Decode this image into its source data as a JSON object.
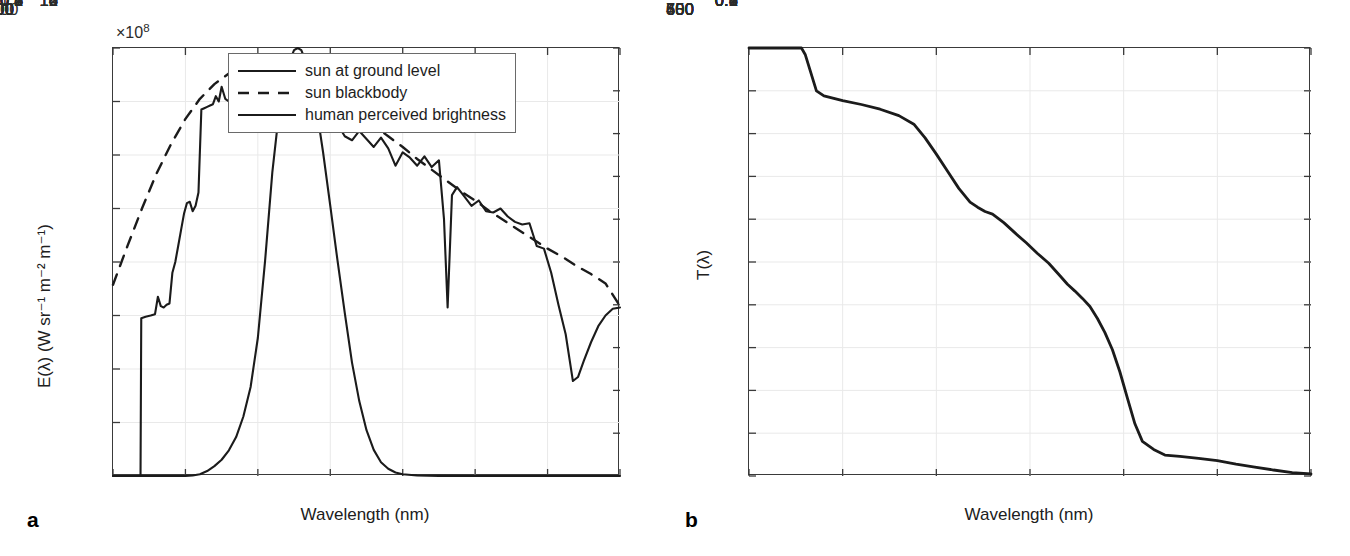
{
  "figure": {
    "panel_a_letter": "a",
    "panel_b_letter": "b"
  },
  "panel_a": {
    "xlabel": "Wavelength (nm)",
    "ylabel_left": "E(λ) (W sr⁻¹ m⁻² m⁻¹)",
    "exponent_label": "×10",
    "exponent_power": "8",
    "legend": [
      {
        "label": "sun at ground level",
        "style": "solid"
      },
      {
        "label": "sun blackbody",
        "style": "dashed"
      },
      {
        "label": "human perceived brightness",
        "style": "solid"
      }
    ]
  },
  "panel_b": {
    "xlabel": "Wavelength (nm)",
    "ylabel": "T(λ)"
  },
  "chart_data": [
    {
      "type": "line",
      "id": "panel-a",
      "title": "",
      "xlabel": "Wavelength (nm)",
      "ylabel": "E(λ) (W sr⁻¹ m⁻² m⁻¹)",
      "ylabel_right": "human perceived brightness (normalized)",
      "xlim": [
        300,
        1000
      ],
      "ylim": [
        0,
        16
      ],
      "ylim_right": [
        0,
        1
      ],
      "y_scale_exponent": 8,
      "xticks": [
        300,
        400,
        500,
        600,
        700,
        800,
        900,
        1000
      ],
      "yticks": [
        0,
        2,
        4,
        6,
        8,
        10,
        12,
        14,
        16
      ],
      "yticks_right": [
        0,
        0.1,
        0.2,
        0.3,
        0.4,
        0.5,
        0.6,
        0.7,
        0.8,
        0.9,
        1
      ],
      "grid": true,
      "legend_position": "upper-center-right",
      "series": [
        {
          "name": "sun at ground level",
          "style": "solid",
          "axis": "left",
          "x": [
            300,
            338,
            339,
            345,
            352,
            358,
            362,
            366,
            370,
            374,
            378,
            382,
            386,
            390,
            394,
            398,
            402,
            406,
            410,
            414,
            418,
            422,
            426,
            430,
            434,
            438,
            442,
            446,
            450,
            455,
            460,
            465,
            470,
            475,
            480,
            485,
            490,
            495,
            500,
            505,
            510,
            515,
            520,
            525,
            530,
            535,
            540,
            545,
            550,
            555,
            560,
            565,
            570,
            575,
            580,
            585,
            590,
            595,
            600,
            610,
            620,
            630,
            640,
            650,
            660,
            670,
            680,
            690,
            700,
            710,
            720,
            730,
            740,
            750,
            757,
            762,
            768,
            775,
            785,
            795,
            805,
            815,
            825,
            835,
            845,
            855,
            865,
            875,
            885,
            895,
            905,
            915,
            925,
            935,
            942,
            950,
            960,
            970,
            980,
            990,
            1000
          ],
          "y": [
            0,
            0,
            5.9,
            5.95,
            6.0,
            6.05,
            6.7,
            6.35,
            6.3,
            6.4,
            6.45,
            7.6,
            8.0,
            8.6,
            9.2,
            9.8,
            10.2,
            10.25,
            9.9,
            10.1,
            10.6,
            13.7,
            13.75,
            13.8,
            13.85,
            13.9,
            14.2,
            14.0,
            14.55,
            14.1,
            14.0,
            14.5,
            13.95,
            14.35,
            13.95,
            14.4,
            14.0,
            14.35,
            14.0,
            14.45,
            14.05,
            14.3,
            14.0,
            14.4,
            13.95,
            14.25,
            14.05,
            14.3,
            13.95,
            14.1,
            13.6,
            13.95,
            13.5,
            13.55,
            13.2,
            13.4,
            13.1,
            13.3,
            12.9,
            13.15,
            12.7,
            12.55,
            12.9,
            12.6,
            12.3,
            12.65,
            12.25,
            11.6,
            12.1,
            11.9,
            11.6,
            11.95,
            11.55,
            11.8,
            9.6,
            6.3,
            10.5,
            10.8,
            10.45,
            10.1,
            10.3,
            9.9,
            9.85,
            10.0,
            9.7,
            9.5,
            9.4,
            9.45,
            8.6,
            8.5,
            7.6,
            6.4,
            5.3,
            3.55,
            3.7,
            4.3,
            5.0,
            5.6,
            6.0,
            6.25,
            6.3
          ]
        },
        {
          "name": "sun blackbody",
          "style": "dashed",
          "axis": "left",
          "x": [
            300,
            320,
            340,
            360,
            380,
            400,
            420,
            440,
            460,
            480,
            500,
            520,
            540,
            560,
            580,
            600,
            620,
            640,
            660,
            680,
            700,
            720,
            740,
            760,
            780,
            800,
            820,
            840,
            860,
            880,
            900,
            920,
            940,
            960,
            980,
            1000
          ],
          "y": [
            7.15,
            8.6,
            10.0,
            11.3,
            12.4,
            13.35,
            14.1,
            14.65,
            15.05,
            15.25,
            15.3,
            15.25,
            15.1,
            14.9,
            14.6,
            14.3,
            13.9,
            13.5,
            13.1,
            12.7,
            12.3,
            11.85,
            11.45,
            11.05,
            10.65,
            10.3,
            9.9,
            9.55,
            9.2,
            8.85,
            8.5,
            8.2,
            7.85,
            7.55,
            7.2,
            6.35
          ]
        },
        {
          "name": "human perceived brightness",
          "style": "solid",
          "axis": "right",
          "x": [
            300,
            380,
            390,
            400,
            410,
            420,
            430,
            440,
            450,
            460,
            470,
            480,
            490,
            500,
            510,
            520,
            530,
            540,
            550,
            555,
            560,
            570,
            580,
            590,
            600,
            610,
            620,
            630,
            640,
            650,
            660,
            670,
            680,
            690,
            700,
            720,
            750,
            800,
            900,
            1000
          ],
          "y": [
            0,
            0,
            0.0001,
            0.0004,
            0.0012,
            0.004,
            0.0116,
            0.023,
            0.038,
            0.06,
            0.091,
            0.139,
            0.208,
            0.323,
            0.503,
            0.71,
            0.862,
            0.954,
            0.995,
            1.0,
            0.995,
            0.952,
            0.87,
            0.757,
            0.631,
            0.503,
            0.381,
            0.265,
            0.175,
            0.107,
            0.061,
            0.032,
            0.017,
            0.0082,
            0.0041,
            0.00105,
            0.00025,
            5e-05,
            0.0,
            0.0
          ]
        }
      ]
    },
    {
      "type": "line",
      "id": "panel-b",
      "title": "",
      "xlabel": "Wavelength (nm)",
      "ylabel": "T(λ)",
      "xlim": [
        400,
        700
      ],
      "ylim": [
        0,
        1
      ],
      "xticks": [
        400,
        450,
        500,
        550,
        600,
        650,
        700
      ],
      "yticks": [
        0,
        0.1,
        0.2,
        0.3,
        0.4,
        0.5,
        0.6,
        0.7,
        0.8,
        0.9,
        1
      ],
      "grid": true,
      "legend_position": "none",
      "series": [
        {
          "name": "T(λ)",
          "style": "solid",
          "x": [
            400,
            410,
            420,
            428,
            430,
            436,
            440,
            450,
            460,
            470,
            480,
            488,
            494,
            500,
            506,
            512,
            518,
            522,
            526,
            530,
            536,
            542,
            548,
            554,
            560,
            566,
            570,
            574,
            578,
            582,
            586,
            590,
            594,
            598,
            602,
            606,
            610,
            616,
            622,
            630,
            640,
            650,
            660,
            670,
            680,
            690,
            700
          ],
          "y": [
            1.0,
            1.0,
            1.0,
            1.0,
            0.985,
            0.9,
            0.888,
            0.877,
            0.868,
            0.857,
            0.842,
            0.822,
            0.79,
            0.752,
            0.712,
            0.672,
            0.64,
            0.628,
            0.618,
            0.612,
            0.592,
            0.568,
            0.545,
            0.52,
            0.497,
            0.468,
            0.448,
            0.432,
            0.415,
            0.396,
            0.368,
            0.335,
            0.295,
            0.243,
            0.182,
            0.122,
            0.081,
            0.062,
            0.049,
            0.046,
            0.041,
            0.036,
            0.028,
            0.021,
            0.014,
            0.008,
            0.005
          ]
        }
      ]
    }
  ]
}
